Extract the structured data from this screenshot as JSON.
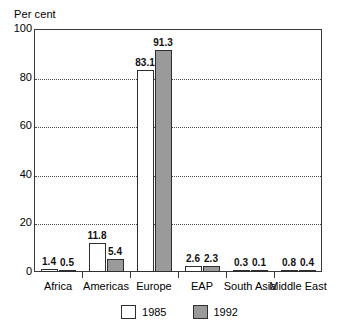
{
  "chart_data": {
    "type": "bar",
    "title": "",
    "subtitle": "",
    "xlabel": "",
    "ylabel": "Per cent",
    "ylim": [
      0,
      100
    ],
    "yticks": [
      0,
      20,
      40,
      60,
      80,
      100
    ],
    "ytick_labels": [
      "0",
      "20",
      "40",
      "60",
      "80",
      "100"
    ],
    "gridlines": [
      20,
      40,
      60,
      80
    ],
    "grid": true,
    "legend_position": "bottom",
    "categories": [
      "Africa",
      "Americas",
      "Europe",
      "EAP",
      "South Asia",
      "Middle East"
    ],
    "series": [
      {
        "name": "1985",
        "color": "#ffffff",
        "values": [
          1.4,
          11.8,
          83.1,
          2.6,
          0.3,
          0.8
        ],
        "labels": [
          "1.4",
          "11.8",
          "83.1",
          "2.6",
          "0.3",
          "0.8"
        ]
      },
      {
        "name": "1992",
        "color": "#9a9a9a",
        "values": [
          0.5,
          5.4,
          91.3,
          2.3,
          0.1,
          0.4
        ],
        "labels": [
          "0.5",
          "5.4",
          "91.3",
          "2.3",
          "0.1",
          "0.4"
        ]
      }
    ]
  },
  "colors": {
    "axis": "#3a3a3a",
    "bar_outline": "#2e2e2e",
    "series_1985": "#ffffff",
    "series_1992": "#9a9a9a",
    "gridline": "#4a4a4a",
    "background": "#ffffff"
  }
}
